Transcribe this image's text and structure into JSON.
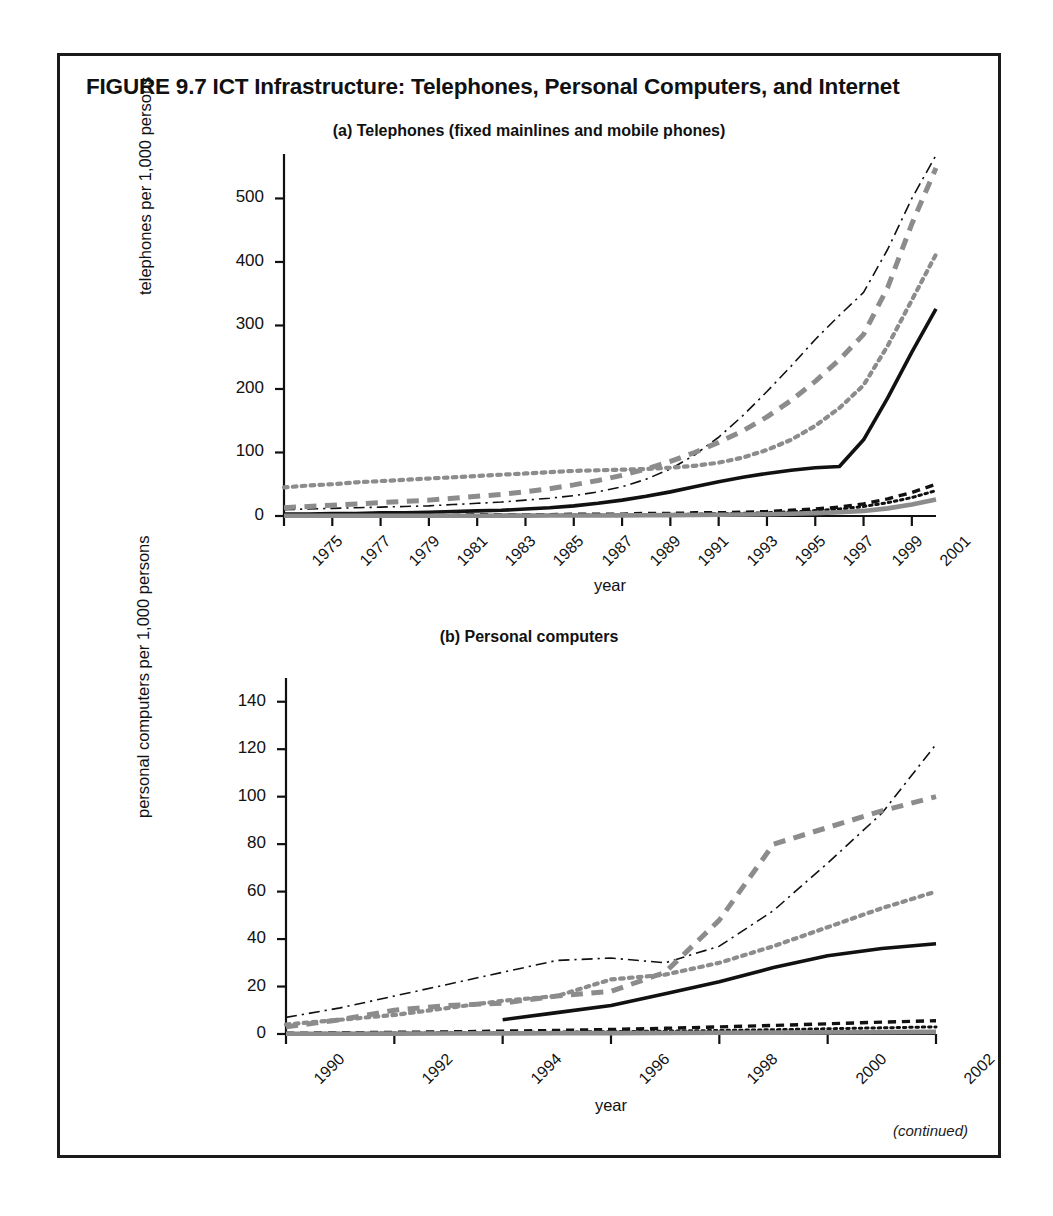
{
  "figure": {
    "title": "FIGURE 9.7  ICT Infrastructure: Telephones, Personal Computers, and Internet",
    "continued_note": "(continued)"
  },
  "colors": {
    "ink": "#111111",
    "gray": "#8c8c8c",
    "frame": "#1b1b1b",
    "paper": "#ffffff"
  },
  "chart_data": [
    {
      "type": "line",
      "panel": "a",
      "title": "(a) Telephones (fixed mainlines and mobile phones)",
      "xlabel": "year",
      "ylabel": "telephones per 1,000 persons",
      "xlim": [
        1975,
        2002
      ],
      "ylim": [
        0,
        570
      ],
      "yticks": [
        0,
        100,
        200,
        300,
        400,
        500
      ],
      "xticks": [
        1975,
        1977,
        1979,
        1981,
        1983,
        1985,
        1987,
        1989,
        1991,
        1993,
        1995,
        1997,
        1999,
        2001
      ],
      "grid": false,
      "legend": "none",
      "x": [
        1975,
        1976,
        1977,
        1978,
        1979,
        1980,
        1981,
        1982,
        1983,
        1984,
        1985,
        1986,
        1987,
        1988,
        1989,
        1990,
        1991,
        1992,
        1993,
        1994,
        1995,
        1996,
        1997,
        1998,
        1999,
        2000,
        2001,
        2002
      ],
      "series": [
        {
          "name": "series-dashdot-thin-black",
          "style": "dash-dot",
          "color": "#111111",
          "width": 1.6,
          "values": [
            10,
            11,
            12,
            13,
            14,
            15,
            16,
            18,
            20,
            22,
            25,
            28,
            32,
            38,
            46,
            58,
            74,
            96,
            124,
            158,
            196,
            236,
            278,
            316,
            352,
            420,
            500,
            568
          ]
        },
        {
          "name": "series-dashed-thick-gray",
          "style": "dashed",
          "color": "#8c8c8c",
          "width": 5.0,
          "values": [
            13,
            15,
            17,
            19,
            21,
            23,
            25,
            28,
            31,
            34,
            38,
            43,
            49,
            56,
            64,
            74,
            86,
            100,
            116,
            134,
            156,
            182,
            212,
            246,
            286,
            360,
            460,
            548
          ]
        },
        {
          "name": "series-dotted-gray",
          "style": "dotted",
          "color": "#8c8c8c",
          "width": 4.2,
          "values": [
            45,
            48,
            50,
            53,
            55,
            57,
            59,
            61,
            63,
            65,
            67,
            69,
            71,
            72,
            73,
            74,
            76,
            79,
            84,
            92,
            104,
            120,
            142,
            170,
            206,
            268,
            340,
            412
          ]
        },
        {
          "name": "series-solid-thick-black",
          "style": "solid",
          "color": "#111111",
          "width": 3.6,
          "values": [
            3,
            3,
            4,
            4,
            5,
            5,
            6,
            7,
            8,
            9,
            11,
            13,
            16,
            20,
            25,
            31,
            38,
            46,
            54,
            61,
            67,
            72,
            76,
            78,
            120,
            186,
            258,
            326
          ]
        },
        {
          "name": "series-dashed-black-low",
          "style": "dashed",
          "color": "#111111",
          "width": 3.4,
          "values": [
            1,
            1,
            1,
            1,
            1,
            1,
            1,
            1,
            2,
            2,
            2,
            2,
            3,
            3,
            3,
            4,
            4,
            5,
            5,
            6,
            7,
            9,
            11,
            14,
            19,
            27,
            37,
            50
          ]
        },
        {
          "name": "series-dotted-black-low",
          "style": "dotted",
          "color": "#111111",
          "width": 3.0,
          "values": [
            0.5,
            0.5,
            0.5,
            0.6,
            0.6,
            0.7,
            0.7,
            0.8,
            0.9,
            1,
            1.1,
            1.2,
            1.4,
            1.6,
            1.9,
            2.2,
            2.6,
            3,
            3.6,
            4.3,
            5.2,
            6.5,
            8.5,
            11,
            15,
            21,
            29,
            40
          ]
        },
        {
          "name": "series-solid-thick-gray-low",
          "style": "solid",
          "color": "#8c8c8c",
          "width": 4.6,
          "values": [
            0.3,
            0.3,
            0.3,
            0.3,
            0.4,
            0.4,
            0.4,
            0.5,
            0.5,
            0.6,
            0.6,
            0.7,
            0.8,
            0.9,
            1,
            1.2,
            1.4,
            1.6,
            1.9,
            2.3,
            2.8,
            3.5,
            4.5,
            6,
            8,
            12,
            18,
            26
          ]
        }
      ]
    },
    {
      "type": "line",
      "panel": "b",
      "title": "(b) Personal computers",
      "xlabel": "year",
      "ylabel": "personal computers per 1,000 persons",
      "xlim": [
        1990,
        2002
      ],
      "ylim": [
        0,
        150
      ],
      "yticks": [
        0,
        20,
        40,
        60,
        80,
        100,
        120,
        140
      ],
      "xticks": [
        1990,
        1992,
        1994,
        1996,
        1998,
        2000,
        2002
      ],
      "grid": false,
      "legend": "none",
      "x": [
        1990,
        1991,
        1992,
        1993,
        1994,
        1995,
        1996,
        1997,
        1998,
        1999,
        2000,
        2001,
        2002
      ],
      "series": [
        {
          "name": "series-dashdot-thin-black",
          "style": "dash-dot",
          "color": "#111111",
          "width": 1.6,
          "values": [
            7,
            11,
            16,
            21,
            26,
            31,
            32,
            30,
            37,
            52,
            72,
            93,
            122,
            147
          ]
        },
        {
          "name": "series-dashed-thick-gray",
          "style": "dashed",
          "color": "#8c8c8c",
          "width": 5.0,
          "values": [
            3,
            6,
            10,
            12,
            13,
            16,
            18,
            26,
            48,
            80,
            87,
            94,
            100,
            105,
            116
          ]
        },
        {
          "name": "series-dotted-gray",
          "style": "dotted",
          "color": "#8c8c8c",
          "width": 4.2,
          "values": [
            4,
            6,
            8,
            11,
            14,
            16,
            23,
            25,
            30,
            37,
            45,
            53,
            60,
            66,
            72
          ]
        },
        {
          "name": "series-solid-thick-black",
          "style": "solid",
          "color": "#111111",
          "width": 3.6,
          "values": [
            null,
            null,
            null,
            null,
            6,
            9,
            12,
            17,
            22,
            28,
            33,
            36,
            38,
            40
          ]
        },
        {
          "name": "series-dashed-black-low",
          "style": "dashed",
          "color": "#111111",
          "width": 3.4,
          "values": [
            0.3,
            0.5,
            0.7,
            0.9,
            1.2,
            1.5,
            1.9,
            2.4,
            3,
            3.6,
            4.3,
            5,
            5.6,
            6.2
          ]
        },
        {
          "name": "series-dotted-black-low",
          "style": "dotted",
          "color": "#111111",
          "width": 3.0,
          "values": [
            0.2,
            0.3,
            0.4,
            0.5,
            0.6,
            0.8,
            1,
            1.2,
            1.5,
            1.8,
            2.2,
            2.6,
            3,
            3.4
          ]
        },
        {
          "name": "series-solid-thick-gray-low",
          "style": "solid",
          "color": "#8c8c8c",
          "width": 4.6,
          "values": [
            0.1,
            0.1,
            0.15,
            0.2,
            0.25,
            0.3,
            0.35,
            0.4,
            0.5,
            0.6,
            0.7,
            0.8,
            0.9,
            1.0
          ]
        }
      ]
    }
  ]
}
